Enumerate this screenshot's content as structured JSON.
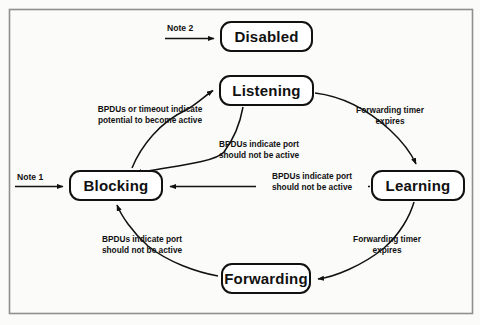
{
  "figure": {
    "kind": "state-transition-diagram",
    "border_color": "#8f8f8f",
    "box_border_color": "#111111",
    "arrow_color": "#111111",
    "background": "#fbfbfa"
  },
  "states": [
    {
      "id": "disabled",
      "label": "Disabled",
      "x": 220,
      "y": 21,
      "w": 93,
      "h": 31
    },
    {
      "id": "listening",
      "label": "Listening",
      "x": 219,
      "y": 75,
      "w": 95,
      "h": 31
    },
    {
      "id": "blocking",
      "label": "Blocking",
      "x": 69,
      "y": 170,
      "w": 94,
      "h": 31
    },
    {
      "id": "learning",
      "label": "Learning",
      "x": 371,
      "y": 170,
      "w": 94,
      "h": 31
    },
    {
      "id": "forwarding",
      "label": "Forwarding",
      "x": 221,
      "y": 263,
      "w": 90,
      "h": 31
    }
  ],
  "notes": [
    {
      "id": "note1",
      "label": "Note 1",
      "x": 17,
      "y": 172
    },
    {
      "id": "note2",
      "label": "Note 2",
      "x": 167,
      "y": 23
    }
  ],
  "edge_labels": [
    {
      "id": "blocking-to-listening",
      "text": "BPDUs or timeout indicate\npotential to become active",
      "x": 82,
      "y": 104,
      "w": 136
    },
    {
      "id": "listening-to-blocking",
      "text": "BPDUs indicate port\nshould not be active",
      "x": 203,
      "y": 139,
      "w": 112
    },
    {
      "id": "listening-to-learning",
      "text": "Forwarding timer\nexpires",
      "x": 347,
      "y": 105,
      "w": 86
    },
    {
      "id": "learning-to-blocking",
      "text": "BPDUs indicate port\nshould not be active",
      "x": 256,
      "y": 171,
      "w": 112
    },
    {
      "id": "learning-to-forwarding",
      "text": "Forwarding timer\nexpires",
      "x": 344,
      "y": 234,
      "w": 86
    },
    {
      "id": "forwarding-to-blocking",
      "text": "BPDUs indicate port\nshould not be active",
      "x": 86,
      "y": 234,
      "w": 112
    }
  ],
  "transitions": [
    {
      "id": "note2-to-disabled",
      "from": "note2",
      "to": "disabled"
    },
    {
      "id": "blocking-to-listening",
      "from": "blocking",
      "to": "listening"
    },
    {
      "id": "note1-to-blocking",
      "from": "note1",
      "to": "blocking"
    },
    {
      "id": "listening-to-blocking",
      "from": "listening",
      "to": "blocking"
    },
    {
      "id": "listening-to-learning",
      "from": "listening",
      "to": "learning"
    },
    {
      "id": "learning-to-blocking",
      "from": "learning",
      "to": "blocking"
    },
    {
      "id": "learning-to-forwarding",
      "from": "learning",
      "to": "forwarding"
    },
    {
      "id": "forwarding-to-blocking",
      "from": "forwarding",
      "to": "blocking"
    }
  ]
}
